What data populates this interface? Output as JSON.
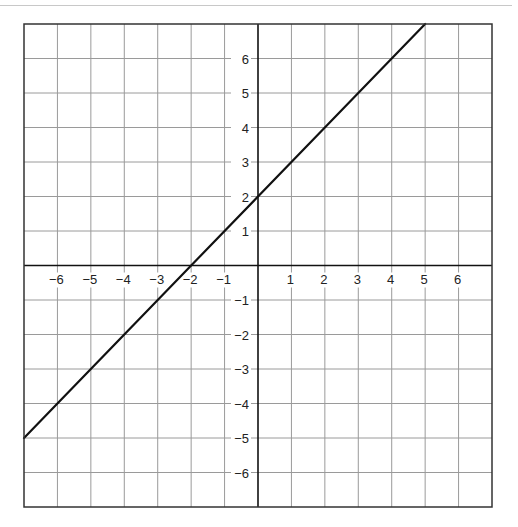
{
  "chart_data": {
    "type": "line",
    "title": "",
    "xlabel": "",
    "ylabel": "",
    "xlim": [
      -7,
      7
    ],
    "ylim": [
      -7,
      7
    ],
    "grid": true,
    "x_ticks": [
      -6,
      -5,
      -4,
      -3,
      -2,
      -1,
      1,
      2,
      3,
      4,
      5,
      6
    ],
    "y_ticks": [
      6,
      5,
      4,
      3,
      2,
      1,
      -1,
      -2,
      -3,
      -4,
      -5,
      -6
    ],
    "x_tick_labels": [
      "−6",
      "−5",
      "−4",
      "−3",
      "−2",
      "−1",
      "1",
      "2",
      "3",
      "4",
      "5",
      "6"
    ],
    "y_tick_labels": [
      "6",
      "5",
      "4",
      "3",
      "2",
      "1",
      "−1",
      "−2",
      "−3",
      "−4",
      "−5",
      "−6"
    ],
    "series": [
      {
        "name": "y = x + 2",
        "slope": 1,
        "intercept": 2,
        "x": [
          -7,
          -2,
          0,
          5
        ],
        "y": [
          -5,
          0,
          2,
          7
        ],
        "color": "#111111"
      }
    ],
    "legend": null
  },
  "colors": {
    "grid": "#9a9a9a",
    "axis": "#111111",
    "border": "#333333",
    "line": "#111111",
    "label": "#222222"
  }
}
